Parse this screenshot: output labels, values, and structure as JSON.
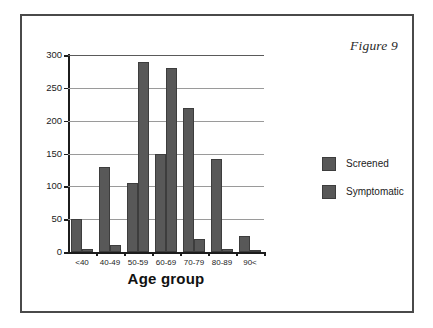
{
  "figure": {
    "caption": "Figure 9"
  },
  "chart_data": {
    "type": "bar",
    "title": "Figure 9",
    "xlabel": "Age group",
    "ylabel": "Frequency",
    "categories": [
      "<40",
      "40-49",
      "50-59",
      "60-69",
      "70-79",
      "80-89",
      "90<"
    ],
    "series": [
      {
        "name": "Screened",
        "color": "#585858",
        "values": [
          50,
          130,
          105,
          150,
          220,
          141,
          25
        ]
      },
      {
        "name": "Symptomatic",
        "color": "#585858",
        "values": [
          5,
          10,
          290,
          280,
          20,
          5,
          2
        ]
      }
    ],
    "ylim": [
      0,
      300
    ],
    "yticks": [
      0,
      50,
      100,
      150,
      200,
      250,
      300
    ],
    "ytick_labels": [
      "0",
      "50",
      "100",
      "150",
      "200",
      "250",
      "300"
    ],
    "grid": true,
    "grid_axis": "y",
    "legend_position": "right",
    "bar_border_color": "#3d3d3d"
  },
  "colors": {
    "frame_border": "#4a4a4a",
    "axis": "#1c1c1c",
    "gridline": "#9a9a9a",
    "bar_fill": "#585858",
    "background": "#ffffff"
  }
}
